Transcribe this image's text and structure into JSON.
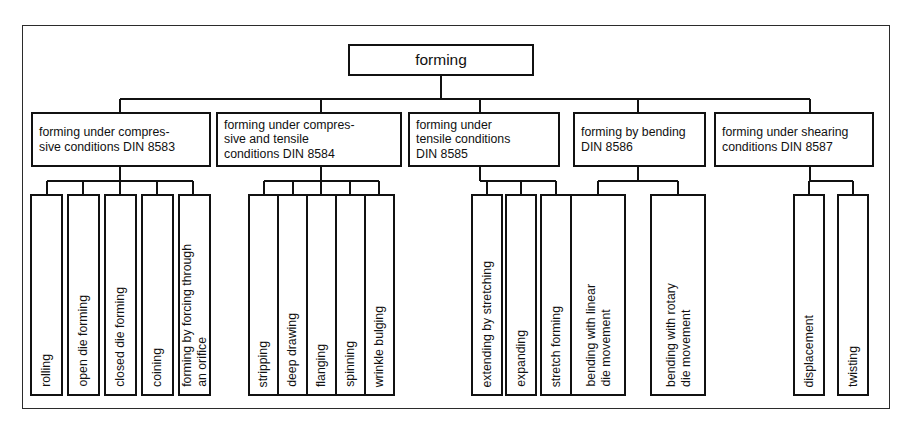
{
  "diagram": {
    "title": "forming",
    "frame": {
      "border_color": "#2b2b2b"
    },
    "colors": {
      "line": "#111111",
      "background": "#ffffff",
      "text": "#111111"
    },
    "root": {
      "label": "forming"
    },
    "categories": [
      {
        "id": "din-8583",
        "label": "forming under compres-\nsive conditions DIN 8583",
        "lines": [
          "forming under compres-",
          "sive conditions DIN 8583"
        ],
        "standard": "DIN 8583",
        "children": [
          {
            "label": "rolling"
          },
          {
            "label": "open die forming"
          },
          {
            "label": "closed die forming"
          },
          {
            "label": "coining"
          },
          {
            "label": "forming by forcing through\nan orifice",
            "lines": [
              "forming by forcing through",
              "an orifice"
            ]
          }
        ]
      },
      {
        "id": "din-8584",
        "label": "forming under compres-\nsive and tensile\nconditions DIN 8584",
        "lines": [
          "forming under compres-",
          "sive and tensile",
          "conditions DIN 8584"
        ],
        "standard": "DIN 8584",
        "children": [
          {
            "label": "stripping"
          },
          {
            "label": "deep drawing"
          },
          {
            "label": "flanging"
          },
          {
            "label": "spinning"
          },
          {
            "label": "wrinkle bulging"
          }
        ]
      },
      {
        "id": "din-8585",
        "label": "forming under\ntensile conditions\n DIN 8585",
        "lines": [
          "forming under",
          "tensile conditions",
          " DIN 8585"
        ],
        "standard": "DIN 8585",
        "children": [
          {
            "label": "extending by stretching"
          },
          {
            "label": "expanding"
          },
          {
            "label": "stretch forming"
          }
        ]
      },
      {
        "id": "din-8586",
        "label": "forming by bending\nDIN 8586",
        "lines": [
          "forming by bending",
          "DIN 8586"
        ],
        "standard": "DIN 8586",
        "children": [
          {
            "label": "bending with linear\ndie movement",
            "lines": [
              "bending with linear",
              "die movement"
            ]
          },
          {
            "label": "bending with rotary\ndie movement",
            "lines": [
              "bending with rotary",
              "die movement"
            ]
          }
        ]
      },
      {
        "id": "din-8587",
        "label": "forming under shearing\nconditions  DIN 8587",
        "lines": [
          "forming under shearing",
          "conditions  DIN 8587"
        ],
        "standard": "DIN 8587",
        "children": [
          {
            "label": "displacement"
          },
          {
            "label": "twisting"
          }
        ]
      }
    ]
  }
}
